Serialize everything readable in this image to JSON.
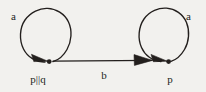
{
  "figure": {
    "kind": "labelled-transition-system",
    "background_color": "#f2f1ee",
    "ink_color": "#231f1d",
    "states": [
      {
        "id": "left",
        "label": "p||q",
        "self_loop_label": "a"
      },
      {
        "id": "right",
        "label": "p",
        "self_loop_label": "a"
      }
    ],
    "transitions": [
      {
        "id": "b-edge",
        "label": "b",
        "from": "p||q",
        "to": "p"
      }
    ]
  }
}
